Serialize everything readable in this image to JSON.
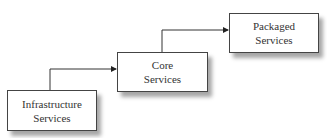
{
  "diagram": {
    "boxes": [
      {
        "id": "infrastructure",
        "line1": "Infrastructure",
        "line2": "Services"
      },
      {
        "id": "core",
        "line1": "Core",
        "line2": "Services"
      },
      {
        "id": "packaged",
        "line1": "Packaged",
        "line2": "Services"
      }
    ],
    "edges": [
      {
        "from": "infrastructure",
        "to": "core"
      },
      {
        "from": "core",
        "to": "packaged"
      }
    ]
  }
}
